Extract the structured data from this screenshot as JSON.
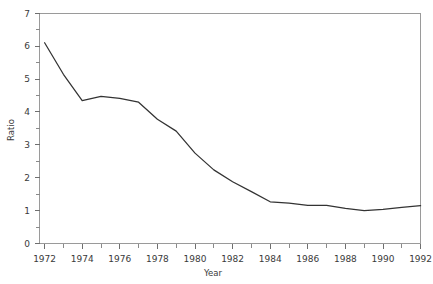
{
  "chart_data": {
    "type": "line",
    "title": "",
    "subtitle": "",
    "xlabel": "Year",
    "ylabel": "Ratio",
    "xlim": [
      1972,
      1992
    ],
    "ylim": [
      0,
      7
    ],
    "grid": false,
    "legend": false,
    "legend_position": "none",
    "x_tick_labels": [
      "1972",
      "1974",
      "1976",
      "1978",
      "1980",
      "1982",
      "1984",
      "1986",
      "1988",
      "1990",
      "1992"
    ],
    "x_tick_values": [
      1972,
      1974,
      1976,
      1978,
      1980,
      1982,
      1984,
      1986,
      1988,
      1990,
      1992
    ],
    "x_minor_ticks": [
      1973,
      1975,
      1977,
      1979,
      1981,
      1983,
      1985,
      1987,
      1989,
      1991
    ],
    "y_tick_labels": [
      "0",
      "1",
      "2",
      "3",
      "4",
      "5",
      "6",
      "7"
    ],
    "y_tick_values": [
      0,
      1,
      2,
      3,
      4,
      5,
      6,
      7
    ],
    "y_minor_ticks": [
      0.5,
      1.5,
      2.5,
      3.5,
      4.5,
      5.5,
      6.5
    ],
    "series": [
      {
        "name": "Ratio",
        "color": "#333333",
        "x": [
          1972,
          1973,
          1974,
          1975,
          1976,
          1977,
          1978,
          1979,
          1980,
          1981,
          1982,
          1983,
          1984,
          1985,
          1986,
          1987,
          1988,
          1989,
          1990,
          1991,
          1992
        ],
        "values": [
          6.11,
          5.15,
          4.35,
          4.48,
          4.42,
          4.3,
          3.78,
          3.42,
          2.75,
          2.24,
          1.88,
          1.58,
          1.27,
          1.23,
          1.16,
          1.16,
          1.07,
          1.0,
          1.04,
          1.1,
          1.15
        ]
      }
    ],
    "annotations": [],
    "colors": {
      "line": "#333333",
      "axis": "#9a9a9a",
      "tick": "#6f6f6f",
      "text": "#3a3a3a",
      "background": "#ffffff"
    }
  },
  "axes": {
    "x_title": "Year",
    "y_title": "Ratio"
  }
}
